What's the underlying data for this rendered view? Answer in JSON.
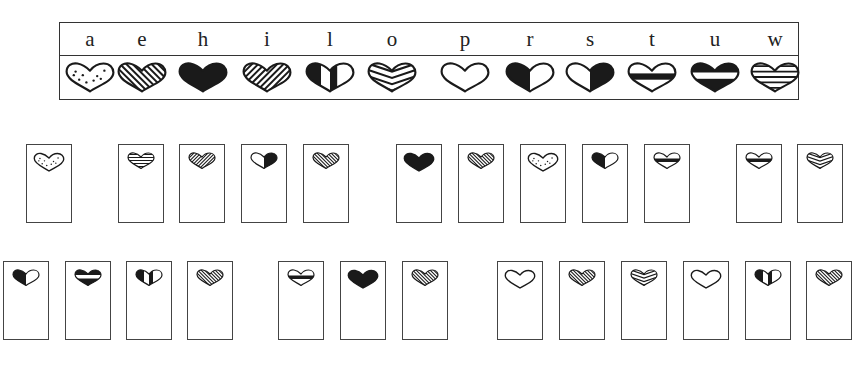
{
  "key": {
    "letters": [
      "a",
      "e",
      "h",
      "i",
      "l",
      "o",
      "p",
      "r",
      "s",
      "t",
      "u",
      "w"
    ],
    "patterns": {
      "a": "dotted",
      "e": "diagonal-stripes-back",
      "h": "solid",
      "i": "diagonal-stripes-forward",
      "l": "vertical-bands",
      "o": "chevron-stripes",
      "p": "outline",
      "r": "left-half-black",
      "s": "right-half-black",
      "t": "black-middle-band",
      "u": "white-middle-band",
      "w": "horizontal-stripes"
    }
  },
  "puzzle": {
    "decoded_message": "a wise heart to rule the people",
    "rows": [
      {
        "words": [
          {
            "letters": [
              "a"
            ]
          },
          {
            "letters": [
              "w",
              "i",
              "s",
              "e"
            ]
          },
          {
            "letters": [
              "h",
              "e",
              "a",
              "r",
              "t"
            ]
          },
          {
            "letters": [
              "t",
              "o"
            ]
          }
        ]
      },
      {
        "words": [
          {
            "letters": [
              "r",
              "u",
              "l",
              "e"
            ]
          },
          {
            "letters": [
              "t",
              "h",
              "e"
            ]
          },
          {
            "letters": [
              "p",
              "e",
              "o",
              "p",
              "l",
              "e"
            ]
          }
        ]
      }
    ]
  },
  "colors": {
    "ink": "#1a1a1a",
    "border": "#444444",
    "background": "#ffffff"
  }
}
